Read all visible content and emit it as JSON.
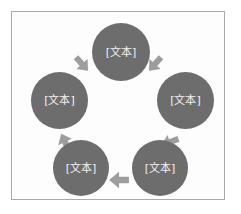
{
  "diagram": {
    "type": "cycle",
    "frame": {
      "border_color": "#a9a9ad",
      "background_color": "#fdfdfd"
    },
    "node_fill_color": "#6d6d6d",
    "node_text_color": "#f2f2f2",
    "arrow_color": "#9d9d9d",
    "nodes": [
      {
        "id": "node-top",
        "label": "[文本]",
        "position": "top"
      },
      {
        "id": "node-right",
        "label": "[文本]",
        "position": "right"
      },
      {
        "id": "node-bottom-right",
        "label": "[文本]",
        "position": "bottom-right"
      },
      {
        "id": "node-bottom-left",
        "label": "[文本]",
        "position": "bottom-left"
      },
      {
        "id": "node-left",
        "label": "[文本]",
        "position": "left"
      }
    ],
    "arrows": [
      {
        "id": "arrow-top-right",
        "from": "node-top",
        "to": "node-right",
        "direction": "down-right"
      },
      {
        "id": "arrow-right-bottom",
        "from": "node-right",
        "to": "node-bottom-right",
        "direction": "down-left"
      },
      {
        "id": "arrow-bottom",
        "from": "node-bottom-right",
        "to": "node-bottom-left",
        "direction": "left"
      },
      {
        "id": "arrow-bottom-left",
        "from": "node-bottom-left",
        "to": "node-left",
        "direction": "up-left"
      },
      {
        "id": "arrow-left-top",
        "from": "node-left",
        "to": "node-top",
        "direction": "up-right"
      }
    ]
  }
}
